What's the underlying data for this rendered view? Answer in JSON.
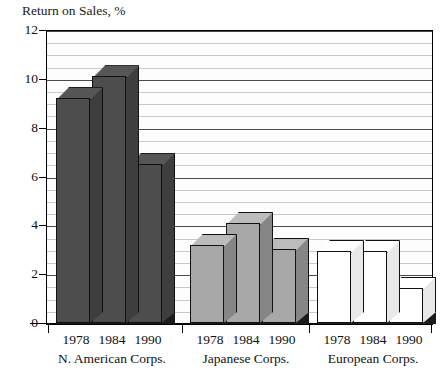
{
  "chart_data": {
    "type": "bar",
    "title": "Return on Sales, %",
    "xlabel": "",
    "ylabel": "Return on Sales, %",
    "ylim": [
      0,
      12
    ],
    "ytick_values": [
      0,
      2,
      4,
      6,
      8,
      10,
      12
    ],
    "ytick_labels": [
      "0",
      "2",
      "4",
      "6",
      "8",
      "10",
      "12"
    ],
    "grid": true,
    "grid_minor_step": 0.5,
    "legend": "none",
    "categories": [
      "1978",
      "1984",
      "1990"
    ],
    "groups": [
      {
        "name": "N. American Corps.",
        "color": "#4d4d4d",
        "values": [
          9.2,
          10.1,
          6.5
        ],
        "bars": [
          {
            "year": "1978",
            "value": 9.2
          },
          {
            "year": "1984",
            "value": 10.1
          },
          {
            "year": "1990",
            "value": 6.5
          }
        ]
      },
      {
        "name": "Japanese Corps.",
        "color": "#a8a8a8",
        "values": [
          3.2,
          4.1,
          3.05
        ],
        "bars": [
          {
            "year": "1978",
            "value": 3.2
          },
          {
            "year": "1984",
            "value": 4.1
          },
          {
            "year": "1990",
            "value": 3.05
          }
        ]
      },
      {
        "name": "European Corps.",
        "color": "#ffffff",
        "values": [
          2.95,
          2.95,
          1.45
        ],
        "bars": [
          {
            "year": "1978",
            "value": 2.95
          },
          {
            "year": "1984",
            "value": 2.95
          },
          {
            "year": "1990",
            "value": 1.45
          }
        ]
      }
    ],
    "series": [
      {
        "name": "N. American Corps.",
        "values": [
          9.2,
          10.1,
          6.5
        ]
      },
      {
        "name": "Japanese Corps.",
        "values": [
          3.2,
          4.1,
          3.05
        ]
      },
      {
        "name": "European Corps.",
        "values": [
          2.95,
          2.95,
          1.45
        ]
      }
    ]
  },
  "axis": {
    "y_labels": [
      "12",
      "10",
      "8",
      "6",
      "4",
      "2",
      "0"
    ],
    "x_year_labels": [
      "1978",
      "1984",
      "1990",
      "1978",
      "1984",
      "1990",
      "1978",
      "1984",
      "1990"
    ],
    "x_group_labels": [
      "N. American Corps.",
      "Japanese Corps.",
      "European Corps."
    ]
  },
  "colors": {
    "north_american": "#4d4d4d",
    "japanese": "#a8a8a8",
    "european": "#ffffff",
    "axis": "#000000",
    "grid_minor": "#c9c9c9",
    "grid_major": "#4a4a4a",
    "plinth": "#1b1b1b"
  }
}
